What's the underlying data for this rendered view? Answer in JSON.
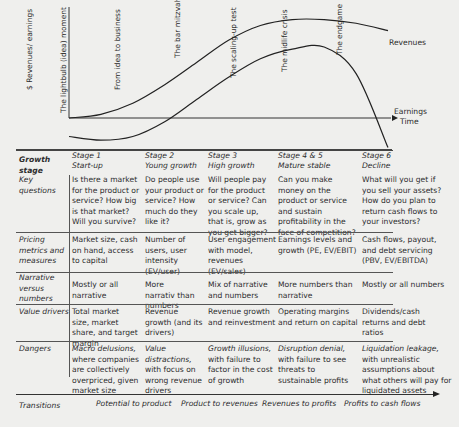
{
  "chart_data": {
    "type": "line",
    "title": "",
    "ylabel": "$ Revenues/ earnings",
    "xlabel": "Time",
    "x": [
      0,
      1,
      2,
      3,
      4,
      5,
      6,
      7,
      8,
      9,
      10
    ],
    "series": [
      {
        "name": "Revenues",
        "values": [
          0,
          0.5,
          2,
          4.5,
          7.5,
          10.5,
          12.5,
          13.3,
          13.3,
          12.8,
          11.8
        ]
      },
      {
        "name": "Earnings",
        "values": [
          -2.5,
          -3,
          -2.5,
          -0.5,
          2.5,
          5.5,
          8,
          9.3,
          9.6,
          6,
          -4
        ]
      }
    ],
    "annotations": [
      "The lightbulb (idea) moment",
      "From idea to business",
      "The bar mitzvah",
      "The scaling-up test",
      "The midlife crisis",
      "The endgame"
    ],
    "series_labels": {
      "revenues": "Revenues",
      "earnings": "Earnings"
    },
    "grid": false,
    "legend": "inline-right"
  },
  "table": {
    "stage_header": "Growth stage",
    "stages": [
      {
        "num": "Stage 1",
        "name": "Start-up"
      },
      {
        "num": "Stage 2",
        "name": "Young growth"
      },
      {
        "num": "Stage 3",
        "name": "High growth"
      },
      {
        "num": "Stage 4 & 5",
        "name": "Mature stable"
      },
      {
        "num": "Stage 6",
        "name": "Decline"
      }
    ],
    "rows": [
      {
        "label": "Key questions",
        "cells": [
          "Is there a market for the product or service? How big is that market? Will you survive?",
          "Do people use your product or service? How much do they like it?",
          "Will people pay for the product or service? Can you scale up, that is, grow as you get bigger?",
          "Can you make money on the product or service and sustain profitability in the face of competition?",
          "What will you get if you sell your assets? How do you plan to return cash flows to your investors?"
        ]
      },
      {
        "label": "Pricing metrics and measures",
        "cells": [
          "Market size, cash on hand, access to capital",
          "Number of users, user intensity (EV/user)",
          "User engagement with model, revenues (EV/sales)",
          "Earnings levels and growth (PE, EV/EBIT)",
          "Cash flows, payout, and debt servicing (PBV, EV/EBITDA)"
        ]
      },
      {
        "label": "Narrative versus numbers",
        "cells": [
          "Mostly or all narrative",
          "More narrativ than numbers",
          "Mix of narrative and numbers",
          "More numbers than narrative",
          "Mostly or all numbers"
        ]
      },
      {
        "label": "Value drivers",
        "cells": [
          "Total market size, market share, and target margin",
          "Revenue growth (and its drivers)",
          "Revenue growth and reinvestment",
          "Operating margins and return on capital",
          "Dividends/cash returns and debt ratios"
        ]
      },
      {
        "label": "Dangers",
        "cells": [
          {
            "title": "Macro delusions,",
            "rest": "where companies are collectively overpriced, given market size"
          },
          {
            "title": "Value distractions,",
            "rest": "with focus on wrong revenue drivers"
          },
          {
            "title": "Growth illusions,",
            "rest": "with failure to factor in the cost of growth"
          },
          {
            "title": "Disruption denial,",
            "rest": "with failure to see threats to sustainable profits"
          },
          {
            "title": "Liquidation leakage,",
            "rest": "with unrealistic assumptions about what others will pay for liquidated assets"
          }
        ]
      }
    ],
    "transitions_label": "Transitions",
    "transitions": [
      "Potential to product",
      "Product to revenues",
      "Revenues to profits",
      "Profits to cash flows"
    ]
  }
}
